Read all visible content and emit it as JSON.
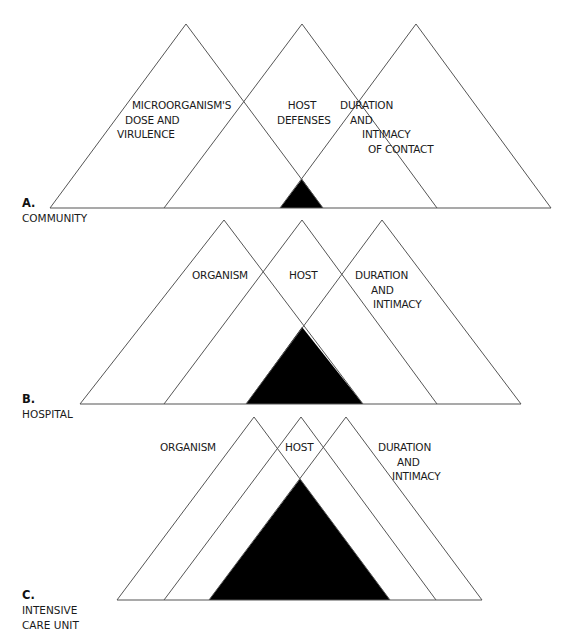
{
  "colors": {
    "line": "#555555",
    "core": "#000000",
    "background": "#ffffff"
  },
  "sections": [
    {
      "id": "A",
      "letter": "A.",
      "name_lines": [
        "COMMUNITY"
      ],
      "baseline_y": 208,
      "apex_y": 24,
      "triangles": [
        {
          "role": "organism",
          "left": 50,
          "apex": 186,
          "right": 323
        },
        {
          "role": "host",
          "left": 164,
          "apex": 302,
          "right": 437
        },
        {
          "role": "duration",
          "left": 280,
          "apex": 416,
          "right": 551
        }
      ],
      "core": {
        "left": 280,
        "apex_x": 302,
        "apex_y": 179,
        "right": 323
      },
      "labels": {
        "organism": [
          "MICROORGANISM'S",
          "DOSE AND",
          "VIRULENCE"
        ],
        "host": [
          "HOST",
          "DEFENSES"
        ],
        "duration": [
          "DURATION",
          "AND",
          "INTIMACY",
          "OF CONTACT"
        ]
      }
    },
    {
      "id": "B",
      "letter": "B.",
      "name_lines": [
        "HOSPITAL"
      ],
      "baseline_y": 404,
      "apex_y": 220,
      "triangles": [
        {
          "role": "organism",
          "left": 80,
          "apex": 224,
          "right": 363
        },
        {
          "role": "host",
          "left": 164,
          "apex": 302,
          "right": 437
        },
        {
          "role": "duration",
          "left": 246,
          "apex": 382,
          "right": 521
        }
      ],
      "core": {
        "left": 246,
        "apex_x": 302,
        "apex_y": 327,
        "right": 363
      },
      "labels": {
        "organism": [
          "ORGANISM"
        ],
        "host": [
          "HOST"
        ],
        "duration": [
          "DURATION",
          "AND",
          "INTIMACY"
        ]
      }
    },
    {
      "id": "C",
      "letter": "C.",
      "name_lines": [
        "INTENSIVE",
        "CARE UNIT"
      ],
      "baseline_y": 600,
      "apex_y": 417,
      "triangles": [
        {
          "role": "organism",
          "left": 117,
          "apex": 254,
          "right": 390
        },
        {
          "role": "host",
          "left": 164,
          "apex": 301,
          "right": 436
        },
        {
          "role": "duration",
          "left": 209,
          "apex": 346,
          "right": 482
        }
      ],
      "core": {
        "left": 209,
        "apex_x": 300,
        "apex_y": 479,
        "right": 390
      },
      "labels": {
        "organism": [
          "ORGANISM"
        ],
        "host": [
          "HOST"
        ],
        "duration": [
          "DURATION",
          "AND",
          "INTIMACY"
        ]
      }
    }
  ]
}
